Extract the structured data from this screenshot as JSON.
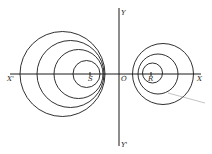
{
  "diagram": {
    "labels": {
      "x_axis_pos": "X",
      "x_axis_neg": "X'",
      "y_axis_pos": "Y",
      "y_axis_neg": "Y'",
      "origin": "O",
      "point_left": "S",
      "point_right": "R"
    },
    "axes": {
      "x": {
        "x1": 10,
        "x2": 201,
        "y": 74
      },
      "y": {
        "x": 119,
        "y1": 8,
        "y2": 146
      }
    },
    "left_circles": [
      {
        "cx": 62.5,
        "cy": 74,
        "r": 42.5
      },
      {
        "cx": 70.5,
        "cy": 74,
        "r": 33.5
      },
      {
        "cx": 78.5,
        "cy": 74,
        "r": 24.5
      },
      {
        "cx": 86.5,
        "cy": 74,
        "r": 13.5
      }
    ],
    "right_circles": [
      {
        "cx": 163,
        "cy": 74,
        "r": 30.5
      },
      {
        "cx": 158,
        "cy": 74,
        "r": 20
      },
      {
        "cx": 152.5,
        "cy": 73,
        "r": 10
      }
    ],
    "pointer_line": {
      "x1": 168,
      "y1": 93,
      "x2": 205,
      "y2": 103
    }
  }
}
